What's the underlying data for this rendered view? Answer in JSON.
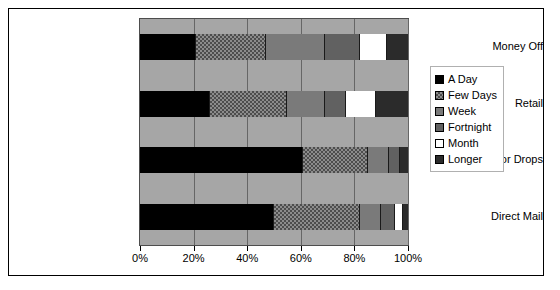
{
  "chart_data": {
    "type": "bar",
    "orientation": "horizontal",
    "stacked": true,
    "stack_mode": "percent",
    "title": "",
    "xlabel": "",
    "ylabel": "",
    "xlim": [
      0,
      100
    ],
    "xticks": [
      0,
      20,
      40,
      60,
      80,
      100
    ],
    "xtick_labels": [
      "0%",
      "20%",
      "40%",
      "60%",
      "80%",
      "100%"
    ],
    "grid": true,
    "legend_position": "right",
    "categories": [
      "Money Off",
      "Retail",
      "Door Drops",
      "Direct Mail"
    ],
    "series": [
      {
        "name": "A Day",
        "color": "#000000",
        "values": [
          21,
          26,
          61,
          50
        ]
      },
      {
        "name": "Few Days",
        "color": "#8c8c8c",
        "values": [
          26,
          29,
          24,
          32
        ]
      },
      {
        "name": "Week",
        "color": "#7a7a7a",
        "values": [
          22,
          14,
          8,
          8
        ]
      },
      {
        "name": "Fortnight",
        "color": "#616161",
        "values": [
          13,
          8,
          4,
          5
        ]
      },
      {
        "name": "Month",
        "color": "#ffffff",
        "values": [
          10,
          11,
          0,
          3
        ]
      },
      {
        "name": "Longer",
        "color": "#2b2b2b",
        "values": [
          8,
          12,
          3,
          2
        ]
      }
    ]
  },
  "legend": {
    "items": [
      {
        "label": "A Day"
      },
      {
        "label": "Few Days"
      },
      {
        "label": "Week"
      },
      {
        "label": "Fortnight"
      },
      {
        "label": "Month"
      },
      {
        "label": "Longer"
      }
    ]
  }
}
